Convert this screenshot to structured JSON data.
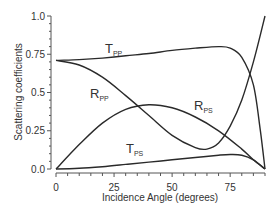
{
  "chart_data": {
    "type": "line",
    "title": "",
    "xlabel": "Incidence Angle (degrees)",
    "ylabel": "Scattering coefficients",
    "xlim": [
      0,
      90
    ],
    "ylim": [
      0,
      1.0
    ],
    "xticks": [
      "0",
      "25",
      "50",
      "75"
    ],
    "yticks": [
      "0.0",
      "0.25",
      "0.5",
      "0.75",
      "1.0"
    ],
    "grid": false,
    "legend": "inline labels",
    "series": [
      {
        "name": "Tpp",
        "label_main": "T",
        "label_sub": "PP",
        "x": [
          0,
          10,
          20,
          30,
          40,
          50,
          60,
          70,
          75,
          80,
          85,
          88,
          90
        ],
        "y": [
          0.71,
          0.715,
          0.725,
          0.74,
          0.755,
          0.775,
          0.79,
          0.8,
          0.79,
          0.73,
          0.55,
          0.25,
          0.0
        ]
      },
      {
        "name": "Rpp",
        "label_main": "R",
        "label_sub": "PP",
        "x": [
          0,
          10,
          20,
          30,
          40,
          50,
          60,
          65,
          70,
          75,
          80,
          85,
          90
        ],
        "y": [
          0.71,
          0.68,
          0.6,
          0.48,
          0.35,
          0.22,
          0.14,
          0.13,
          0.17,
          0.28,
          0.45,
          0.7,
          1.0
        ]
      },
      {
        "name": "Rps",
        "label_main": "R",
        "label_sub": "PS",
        "x": [
          0,
          10,
          20,
          30,
          40,
          50,
          60,
          70,
          80,
          85,
          90
        ],
        "y": [
          0.0,
          0.16,
          0.3,
          0.39,
          0.42,
          0.4,
          0.34,
          0.25,
          0.13,
          0.06,
          0.0
        ]
      },
      {
        "name": "Tps",
        "label_main": "T",
        "label_sub": "PS",
        "x": [
          0,
          10,
          20,
          30,
          40,
          50,
          60,
          70,
          75,
          80,
          85,
          90
        ],
        "y": [
          0.0,
          0.005,
          0.015,
          0.03,
          0.045,
          0.06,
          0.075,
          0.09,
          0.095,
          0.09,
          0.06,
          0.0
        ]
      }
    ]
  }
}
